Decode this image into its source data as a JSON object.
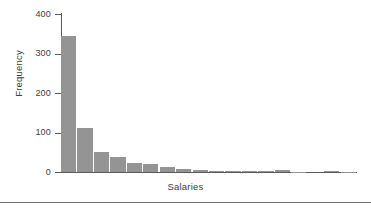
{
  "chart_data": {
    "type": "bar",
    "title": "",
    "subtitle": "",
    "xlabel": "Salaries",
    "ylabel": "Frequency",
    "categories": [
      "1",
      "2",
      "3",
      "4",
      "5",
      "6",
      "7",
      "8",
      "9",
      "10",
      "11",
      "12",
      "13",
      "14",
      "15",
      "16",
      "17",
      "18"
    ],
    "values": [
      345,
      112,
      51,
      38,
      23,
      20,
      13,
      7,
      6,
      3,
      2,
      2,
      2,
      4,
      1,
      0,
      2,
      1
    ],
    "ylim": [
      0,
      400
    ],
    "y_ticks": [
      0,
      100,
      200,
      300,
      400
    ],
    "y_tick_labels": [
      "0",
      "100",
      "200",
      "300",
      "400"
    ],
    "x_ticks": [],
    "x_tick_labels": [],
    "grid": false,
    "legend": false,
    "legend_position": "none",
    "annotations": [],
    "bar_color": "#949494",
    "axis_color": "#5a5a5a",
    "text_color": "#3c3c3c",
    "background_color": "#ffffff"
  },
  "figure": {
    "bottom_rule_color": "#6e6e6e"
  }
}
